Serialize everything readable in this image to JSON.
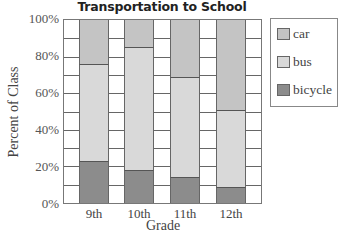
{
  "chart_data": {
    "type": "bar",
    "stacked": true,
    "title": "Transportation to School",
    "xlabel": "Grade",
    "ylabel": "Percent of Class",
    "categories": [
      "9th",
      "10th",
      "11th",
      "12th"
    ],
    "series": [
      {
        "name": "bicycle",
        "color": "#8c8c8c",
        "values": [
          23,
          18,
          14,
          9
        ]
      },
      {
        "name": "bus",
        "color": "#d9d9d9",
        "values": [
          53,
          67,
          55,
          42
        ]
      },
      {
        "name": "car",
        "color": "#c4c4c4",
        "values": [
          24,
          15,
          31,
          49
        ]
      }
    ],
    "ylim": [
      0,
      100
    ],
    "yticks": [
      "0%",
      "20%",
      "40%",
      "60%",
      "80%",
      "100%"
    ],
    "grid": true,
    "grid_step": 10,
    "legend_position": "right",
    "legend_order": [
      "car",
      "bus",
      "bicycle"
    ]
  }
}
